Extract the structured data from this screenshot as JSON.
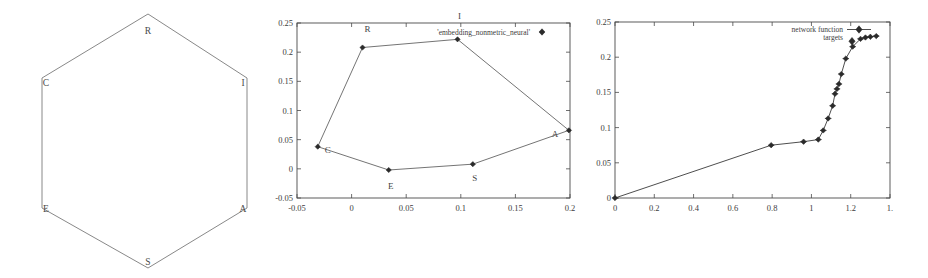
{
  "figure": {
    "title": "",
    "panels": [
      "hexagon-diagram",
      "embedding-scatter",
      "network-function-plot"
    ]
  },
  "hexagon": {
    "caption": "",
    "vertices": [
      {
        "label": "R",
        "x": 148,
        "y": 14,
        "lx": 148,
        "ly": 34
      },
      {
        "label": "I",
        "x": 247,
        "y": 78,
        "lx": 243,
        "ly": 86
      },
      {
        "label": "A",
        "x": 247,
        "y": 208,
        "lx": 243,
        "ly": 212
      },
      {
        "label": "S",
        "x": 148,
        "y": 268,
        "lx": 148,
        "ly": 265
      },
      {
        "label": "E",
        "x": 42,
        "y": 208,
        "lx": 46,
        "ly": 212
      },
      {
        "label": "C",
        "x": 42,
        "y": 78,
        "lx": 46,
        "ly": 86
      }
    ]
  },
  "chart_data": [
    {
      "id": "embedding-scatter",
      "type": "scatter",
      "title": "",
      "xlabel": "",
      "ylabel": "",
      "legend": [
        "'embedding_nonmetric_neural'"
      ],
      "legend_position": "top-center",
      "grid": false,
      "xlim": [
        -0.05,
        0.2
      ],
      "ylim": [
        -0.05,
        0.25
      ],
      "xticks": [
        -0.05,
        0,
        0.05,
        0.1,
        0.15,
        0.2
      ],
      "xticklabels": [
        "-0.05",
        "0",
        "0.05",
        "0.1",
        "0.15",
        "0.2"
      ],
      "yticks": [
        -0.05,
        0,
        0.05,
        0.1,
        0.15,
        0.2,
        0.25
      ],
      "yticklabels": [
        "-0.05",
        "0",
        "0.05",
        "0.1",
        "0.15",
        "0.2",
        "0.25"
      ],
      "points": [
        {
          "label": "C",
          "x": -0.031,
          "y": 0.038,
          "label_dx": 10,
          "label_dy": -6
        },
        {
          "label": "R",
          "x": 0.01,
          "y": 0.208,
          "label_dx": 5,
          "label_dy": 16
        },
        {
          "label": "I",
          "x": 0.097,
          "y": 0.222,
          "label_dx": 2,
          "label_dy": 20
        },
        {
          "label": "A",
          "x": 0.199,
          "y": 0.066,
          "label_dx": -14,
          "label_dy": -7
        },
        {
          "label": "S",
          "x": 0.111,
          "y": 0.008,
          "label_dx": 2,
          "label_dy": -17
        },
        {
          "label": "E",
          "x": 0.034,
          "y": -0.002,
          "label_dx": 2,
          "label_dy": -19
        }
      ],
      "polygon_order": [
        "C",
        "R",
        "I",
        "A",
        "S",
        "E",
        "C"
      ]
    },
    {
      "id": "network-function-plot",
      "type": "line",
      "title": "",
      "xlabel": "",
      "ylabel": "",
      "legend": [
        "network function",
        "targets"
      ],
      "legend_position": "top-right",
      "grid": false,
      "xlim": [
        0,
        1.4
      ],
      "ylim": [
        0,
        0.25
      ],
      "xticks": [
        0,
        0.2,
        0.4,
        0.6,
        0.8,
        1.0,
        1.2,
        1.4
      ],
      "xticklabels": [
        "0",
        "0.2",
        "0.4",
        "0.6",
        "0.8",
        "1",
        "1.2",
        "1."
      ],
      "yticks": [
        0,
        0.05,
        0.1,
        0.15,
        0.2,
        0.25
      ],
      "yticklabels": [
        "0",
        "0.05",
        "0.1",
        "0.15",
        "0.2",
        "0.25"
      ],
      "series": [
        {
          "name": "network function",
          "x": [
            0.0,
            0.795,
            0.96,
            1.035,
            1.06,
            1.085,
            1.108,
            1.12,
            1.13,
            1.14,
            1.152,
            1.175,
            1.21,
            1.25,
            1.275,
            1.3,
            1.33
          ],
          "y": [
            0.0,
            0.075,
            0.08,
            0.083,
            0.096,
            0.113,
            0.131,
            0.148,
            0.155,
            0.162,
            0.176,
            0.198,
            0.215,
            0.226,
            0.228,
            0.229,
            0.23
          ]
        }
      ]
    }
  ]
}
